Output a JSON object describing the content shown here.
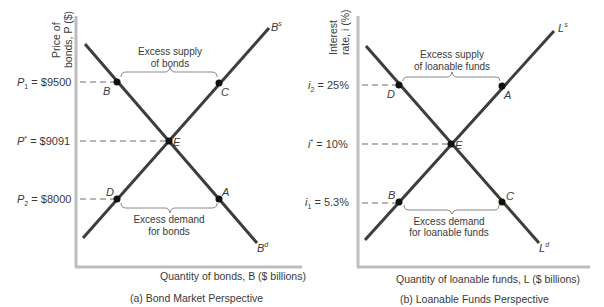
{
  "panel_a": {
    "caption": "(a) Bond Market Perspective",
    "y_label_line1": "Price of",
    "y_label_line2": "bonds, P ($)",
    "x_label": "Quantity of bonds, B ($ billions)",
    "supply_curve": "B",
    "supply_sup": "s",
    "demand_curve": "B",
    "demand_sup": "d",
    "p1_label": "P",
    "p1_sub": "1",
    "p1_value": " = $9500",
    "pstar_label": "P",
    "pstar_sup": "*",
    "pstar_value": " = $9091",
    "p2_label": "P",
    "p2_sub": "2",
    "p2_value": " = $8000",
    "excess_supply_line1": "Excess supply",
    "excess_supply_line2": "of bonds",
    "excess_demand_line1": "Excess demand",
    "excess_demand_line2": "for bonds",
    "points": {
      "B": "B",
      "C": "C",
      "E": "E",
      "D": "D",
      "A": "A"
    }
  },
  "panel_b": {
    "caption": "(b) Loanable Funds Perspective",
    "y_label_line1": "Interest",
    "y_label_line2": "rate, i (%)",
    "x_label": "Quantity of loanable funds, L ($ billions)",
    "supply_curve": "L",
    "supply_sup": "s",
    "demand_curve": "L",
    "demand_sup": "d",
    "i2_label": "i",
    "i2_sub": "2",
    "i2_value": " = 25%",
    "istar_label": "i",
    "istar_sup": "*",
    "istar_value": " = 10%",
    "i1_label": "i",
    "i1_sub": "1",
    "i1_value": " = 5.3%",
    "excess_supply_line1": "Excess supply",
    "excess_supply_line2": "of loanable funds",
    "excess_demand_line1": "Excess demand",
    "excess_demand_line2": "for loanable funds",
    "points": {
      "D": "D",
      "A": "A",
      "E": "E",
      "B": "B",
      "C": "C"
    }
  },
  "colors": {
    "curve": "#3d3d3d",
    "axis": "#bdbdbd",
    "dash": "#6a6a6a",
    "text": "#3a3a3a"
  }
}
